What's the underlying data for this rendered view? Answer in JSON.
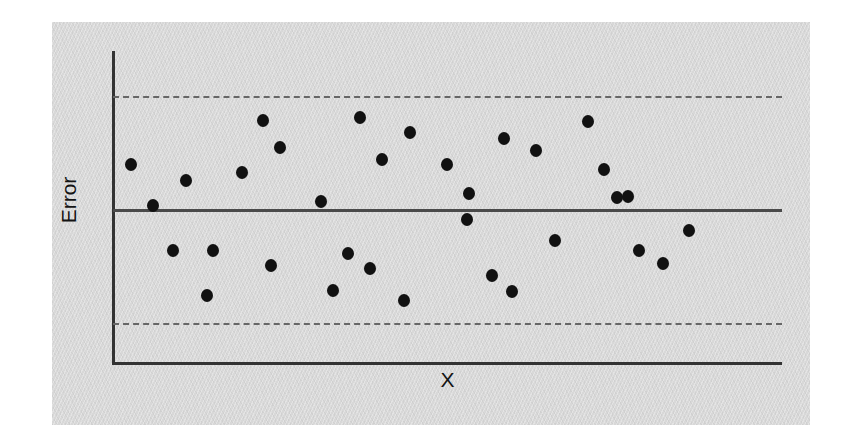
{
  "figure": {
    "background_color": "#ffffff",
    "panel_color": "#d8d8d8",
    "point_color": "#111111",
    "axis_color": "#333333",
    "zero_line_color": "#4a4a4a",
    "limit_line_color": "#666666"
  },
  "labels": {
    "y_axis": "Error",
    "x_axis": "X"
  },
  "chart_data": {
    "type": "scatter",
    "title": "",
    "subtitle": "",
    "xlabel": "X",
    "ylabel": "Error",
    "xlim": [
      0,
      100
    ],
    "ylim": [
      -100,
      100
    ],
    "grid": false,
    "legend": null,
    "annotations": [],
    "reference_lines": [
      {
        "name": "zero-line",
        "y": 0,
        "style": "solid",
        "color": "#4a4a4a"
      },
      {
        "name": "upper-control-limit",
        "y": 72,
        "style": "dashed",
        "color": "#666666"
      },
      {
        "name": "lower-control-limit",
        "y": -72,
        "style": "dashed",
        "color": "#666666"
      }
    ],
    "series": [
      {
        "name": "Residuals",
        "marker": "circle",
        "color": "#111111",
        "points": [
          {
            "x": 3.0,
            "y": 36
          },
          {
            "x": 6.3,
            "y": 4
          },
          {
            "x": 11.0,
            "y": 24
          },
          {
            "x": 9.0,
            "y": -38
          },
          {
            "x": 14.9,
            "y": -29
          },
          {
            "x": 19.3,
            "y": 30
          },
          {
            "x": 23.6,
            "y": 62
          },
          {
            "x": 21.4,
            "y": -25
          },
          {
            "x": 26.1,
            "y": -53
          },
          {
            "x": 27.2,
            "y": 47
          },
          {
            "x": 31.6,
            "y": 20
          },
          {
            "x": 35.2,
            "y": -12
          },
          {
            "x": 33.3,
            "y": -57
          },
          {
            "x": 39.6,
            "y": 64
          },
          {
            "x": 43.2,
            "y": 32
          },
          {
            "x": 40.4,
            "y": -30
          },
          {
            "x": 47.7,
            "y": 52
          },
          {
            "x": 50.2,
            "y": -62
          },
          {
            "x": 53.8,
            "y": 36
          },
          {
            "x": 56.5,
            "y": 10
          },
          {
            "x": 56.5,
            "y": -5
          },
          {
            "x": 61.2,
            "y": 57
          },
          {
            "x": 59.6,
            "y": -40
          },
          {
            "x": 65.8,
            "y": 44
          },
          {
            "x": 63.1,
            "y": -57
          },
          {
            "x": 68.9,
            "y": -24
          },
          {
            "x": 72.7,
            "y": 63
          },
          {
            "x": 74.4,
            "y": 31
          },
          {
            "x": 77.6,
            "y": 11
          },
          {
            "x": 78.8,
            "y": -20
          },
          {
            "x": 82.1,
            "y": -30
          },
          {
            "x": 84.9,
            "y": -8
          },
          {
            "x": 69.5,
            "y": 10
          }
        ]
      }
    ]
  },
  "point_positions": [
    {
      "name": "point-1",
      "left": 131,
      "top": 164
    },
    {
      "name": "point-2",
      "left": 153,
      "top": 205
    },
    {
      "name": "point-3",
      "left": 186,
      "top": 180
    },
    {
      "name": "point-4",
      "left": 173,
      "top": 250
    },
    {
      "name": "point-5",
      "left": 213,
      "top": 250
    },
    {
      "name": "point-6",
      "left": 242,
      "top": 172
    },
    {
      "name": "point-7",
      "left": 263,
      "top": 120
    },
    {
      "name": "point-8",
      "left": 207,
      "top": 295
    },
    {
      "name": "point-9",
      "left": 271,
      "top": 265
    },
    {
      "name": "point-10",
      "left": 280,
      "top": 147
    },
    {
      "name": "point-11",
      "left": 321,
      "top": 201
    },
    {
      "name": "point-12",
      "left": 348,
      "top": 253
    },
    {
      "name": "point-13",
      "left": 333,
      "top": 290
    },
    {
      "name": "point-14",
      "left": 360,
      "top": 117
    },
    {
      "name": "point-15",
      "left": 382,
      "top": 159
    },
    {
      "name": "point-16",
      "left": 370,
      "top": 268
    },
    {
      "name": "point-17",
      "left": 410,
      "top": 132
    },
    {
      "name": "point-18",
      "left": 404,
      "top": 300
    },
    {
      "name": "point-19",
      "left": 447,
      "top": 164
    },
    {
      "name": "point-20",
      "left": 469,
      "top": 193
    },
    {
      "name": "point-21",
      "left": 467,
      "top": 219
    },
    {
      "name": "point-22",
      "left": 504,
      "top": 138
    },
    {
      "name": "point-23",
      "left": 492,
      "top": 275
    },
    {
      "name": "point-24",
      "left": 536,
      "top": 150
    },
    {
      "name": "point-25",
      "left": 512,
      "top": 291
    },
    {
      "name": "point-26",
      "left": 555,
      "top": 240
    },
    {
      "name": "point-27",
      "left": 588,
      "top": 121
    },
    {
      "name": "point-28",
      "left": 604,
      "top": 169
    },
    {
      "name": "point-29",
      "left": 628,
      "top": 196
    },
    {
      "name": "point-30",
      "left": 639,
      "top": 250
    },
    {
      "name": "point-31",
      "left": 663,
      "top": 263
    },
    {
      "name": "point-32",
      "left": 689,
      "top": 230
    },
    {
      "name": "point-33",
      "left": 617,
      "top": 197
    }
  ]
}
